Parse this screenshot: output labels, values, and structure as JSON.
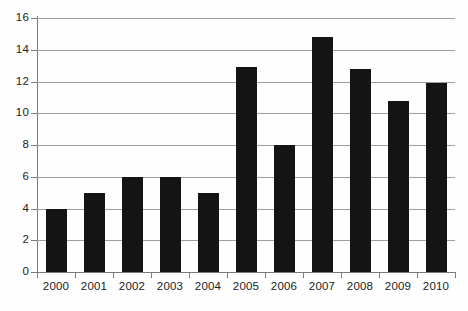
{
  "chart_data": {
    "type": "bar",
    "title": "",
    "subtitle": "",
    "xlabel": "",
    "ylabel": "",
    "categories": [
      "2000",
      "2001",
      "2002",
      "2003",
      "2004",
      "2005",
      "2006",
      "2007",
      "2008",
      "2009",
      "2010"
    ],
    "values": [
      4,
      5,
      6,
      6,
      5,
      12.9,
      8,
      14.8,
      12.8,
      10.8,
      11.9
    ],
    "ylim": [
      0,
      16
    ],
    "ytick_labels": [
      "0",
      "2",
      "4",
      "6",
      "8",
      "10",
      "12",
      "14",
      "16"
    ],
    "ytick_values": [
      0,
      2,
      4,
      6,
      8,
      10,
      12,
      14,
      16
    ],
    "grid": "horizontal",
    "legend": "none",
    "series": [
      {
        "name": "",
        "values": [
          4,
          5,
          6,
          6,
          5,
          12.9,
          8,
          14.8,
          12.8,
          10.8,
          11.9
        ]
      }
    ],
    "colors": {
      "bar": "#141414",
      "gridline": "#9e9e9e",
      "axis": "#7a7a7a",
      "label": "#1c1c1c",
      "background": "#fefefe"
    }
  }
}
